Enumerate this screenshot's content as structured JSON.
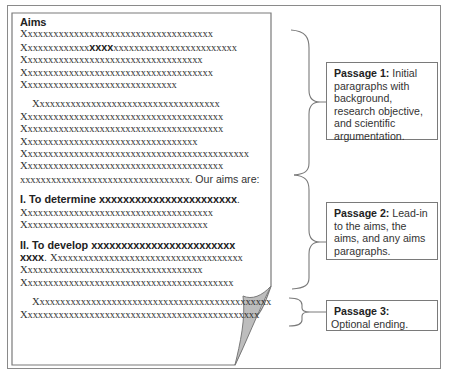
{
  "document": {
    "heading": "Aims",
    "paragraph1": [
      "Xxxxxxxxxxxxxxxxxxxxxxxxxxxxxxxxxxxxx",
      {
        "pre": "Xxxxxxxxxxxxx",
        "bold": "xxxx",
        "post": "xxxxxxxxxxxxxxxxxxxxxxxx"
      },
      "Xxxxxxxxxxxxxxxxxxxxxxxxxxxxxxxxxxx",
      "Xxxxxxxxxxxxxxxxxxxxxxxxxxxxxxxxxxxxx",
      "Xxxxxxxxxxxxxxxxxxxxxxxxxxxxxx"
    ],
    "paragraph2": [
      "Xxxxxxxxxxxxxxxxxxxxxxxxxxxxxxxxxxxx",
      "Xxxxxxxxxxxxxxxxxxxxxxxxxxxxxxxxxxxxxxx",
      "Xxxxxxxxxxxxxxxxxxxxxxxxxxxxxxxxxxxxxxx",
      "Xxxxxxxxxxxxxxxxxxxxxxxxxxxxxxxxxx",
      "Xxxxxxxxxxxxxxxxxxxxxxxxxxxxxxxxxxxxxxxxxxxx",
      "Xxxxxxxxxxxxxxxxxxxxxxxxxxxxxxxxxxxxxxx"
    ],
    "leadin": {
      "text": "xxxxxxxxxxxxxxxxxxxxxxxxxxxxxxxxx.",
      "tail": " Our aims are:"
    },
    "aim1": {
      "title": "I.  To determine xxxxxxxxxxxxxxxxxxxxxxx",
      "punct": ".",
      "lines": [
        "Xxxxxxxxxxxxxxxxxxxxxxxxxxxxxxxxxxxxx",
        "Xxxxxxxxxxxxxxxxxxxxxxxxxxxxxxxxxxxx"
      ]
    },
    "aim2": {
      "title": "II. To develop xxxxxxxxxxxxxxxxxxxxxxxx",
      "title_cont": "xxxx",
      "title_punct": ". ",
      "first_line_rest": "Xxxxxxxxxxxxxxxxxxxxxxxxxxxxxxxxxxxxx",
      "lines": [
        "Xxxxxxxxxxxxxxxxxxxxxxxxxxxxxxxxxxx",
        "Xxxxxxxxxxxxxxxxxxxxxxxxxxxxxxxxxxxxxxxxx"
      ]
    },
    "ending": [
      "Xxxxxxxxxxxxxxxxxxxxxxxxxxxxxxxxxxxxxxxxxxxxxx",
      "Xxxxxxxxxxxxxxxxxxxxxxxxxxxxxxxxxxxxxxxxxxxxxx"
    ]
  },
  "annotations": [
    {
      "title": "Passage 1:",
      "text": " Initial paragraphs with background, research objective, and scientific argumentation."
    },
    {
      "title": "Passage 2:",
      "text": " Lead-in to the aims, the aims, and any aims paragraphs."
    },
    {
      "title": "Passage 3:",
      "text": " Optional ending."
    }
  ],
  "colors": {
    "border": "#7a7a7a",
    "text": "#333333",
    "curl_fill": "#bdbdbd"
  }
}
